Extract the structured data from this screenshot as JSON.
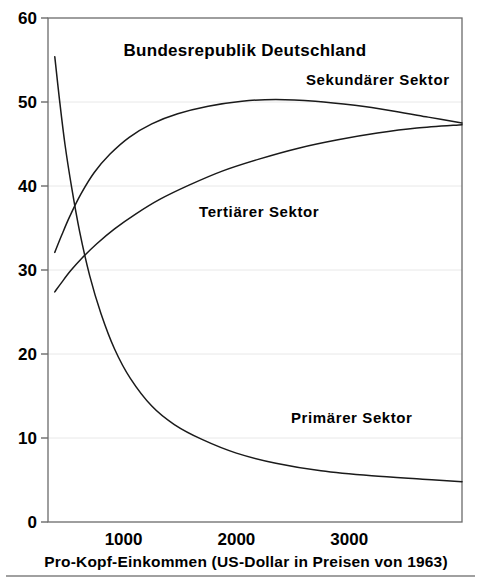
{
  "chart_data": {
    "type": "line",
    "title": "Bundesrepublik Deutschland",
    "xlabel": "Pro-Kopf-Einkommen (US-Dollar in Preisen von 1963)",
    "ylabel": "",
    "xlim": [
      330,
      4000
    ],
    "ylim": [
      0,
      60
    ],
    "grid": true,
    "legend_position": "inline-annotations",
    "xticks": [
      1000,
      2000,
      3000
    ],
    "xtick_labels": [
      "1000",
      "2000",
      "3000"
    ],
    "yticks": [
      0,
      10,
      20,
      30,
      40,
      50,
      60
    ],
    "ytick_labels": [
      "0",
      "10",
      "20",
      "30",
      "40",
      "50",
      "60"
    ],
    "series": [
      {
        "name": "Primärer Sektor",
        "label": "Primärer Sektor",
        "x": [
          390,
          430,
          480,
          540,
          610,
          700,
          800,
          920,
          1060,
          1250,
          1450,
          1700,
          2000,
          2350,
          2750,
          3200,
          3650,
          4000
        ],
        "values": [
          55.4,
          50.5,
          45.0,
          39.8,
          34.6,
          29.3,
          24.8,
          20.6,
          17.1,
          13.8,
          11.6,
          9.8,
          8.2,
          7.0,
          6.1,
          5.5,
          5.1,
          4.8
        ]
      },
      {
        "name": "Sekundärer Sektor",
        "label": "Sekundärer Sektor",
        "x": [
          390,
          450,
          520,
          620,
          740,
          880,
          1050,
          1250,
          1480,
          1750,
          2050,
          2350,
          2700,
          3050,
          3400,
          3700,
          4000
        ],
        "values": [
          32.1,
          34.1,
          36.3,
          39.0,
          41.6,
          43.8,
          45.8,
          47.4,
          48.6,
          49.5,
          50.1,
          50.3,
          50.1,
          49.6,
          48.9,
          48.2,
          47.5
        ]
      },
      {
        "name": "Tertiärer Sektor",
        "label": "Tertiärer Sektor",
        "x": [
          390,
          450,
          530,
          630,
          760,
          920,
          1100,
          1320,
          1580,
          1880,
          2200,
          2550,
          2900,
          3250,
          3600,
          4000
        ],
        "values": [
          27.4,
          28.5,
          29.9,
          31.4,
          33.1,
          34.9,
          36.6,
          38.4,
          40.1,
          41.8,
          43.2,
          44.5,
          45.5,
          46.3,
          46.9,
          47.3
        ]
      }
    ],
    "annotations": [
      {
        "text": "Sekundärer Sektor",
        "x_px": 306,
        "y_px": 85
      },
      {
        "text": "Tertiärer Sektor",
        "x_px": 199,
        "y_px": 217
      },
      {
        "text": "Primärer Sektor",
        "x_px": 291,
        "y_px": 423
      }
    ]
  },
  "geometry": {
    "plot_left": 48,
    "plot_right": 462,
    "plot_top": 18,
    "plot_bottom": 522,
    "title_x": 245,
    "title_y": 56,
    "xlabel_x": 246,
    "xlabel_y": 567,
    "footer_rule_y": 576
  }
}
